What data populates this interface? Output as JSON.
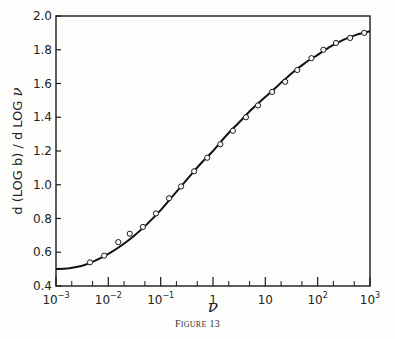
{
  "chart_data": {
    "type": "line",
    "title": "",
    "caption": "Figure 13",
    "xlabel": "ν",
    "ylabel": "d (LOG b) / d LOG ν",
    "xscale": "log",
    "xlim": [
      0.001,
      1000
    ],
    "ylim": [
      0.4,
      2.0
    ],
    "grid": false,
    "legend": null,
    "x_ticks": [
      "10^-3",
      "10^-2",
      "10^-1",
      "1",
      "10",
      "10^2",
      "10^3"
    ],
    "y_ticks": [
      "0.4",
      "0.6",
      "0.8",
      "1.0",
      "1.2",
      "1.4",
      "1.6",
      "1.8",
      "2.0"
    ],
    "series": [
      {
        "name": "theory (solid curve)",
        "style": "line",
        "log10_x": [
          -3.0,
          -2.75,
          -2.5,
          -2.25,
          -2.0,
          -1.75,
          -1.5,
          -1.25,
          -1.0,
          -0.75,
          -0.5,
          -0.25,
          0.0,
          0.25,
          0.5,
          0.75,
          1.0,
          1.25,
          1.5,
          1.75,
          2.0,
          2.25,
          2.5,
          2.75,
          3.0
        ],
        "values": [
          0.5,
          0.505,
          0.52,
          0.55,
          0.59,
          0.64,
          0.7,
          0.77,
          0.85,
          0.94,
          1.03,
          1.12,
          1.2,
          1.29,
          1.37,
          1.45,
          1.52,
          1.59,
          1.66,
          1.72,
          1.77,
          1.82,
          1.86,
          1.89,
          1.91
        ]
      },
      {
        "name": "data (open circles)",
        "style": "scatter",
        "log10_x": [
          -2.35,
          -2.08,
          -1.81,
          -1.59,
          -1.34,
          -1.09,
          -0.84,
          -0.61,
          -0.36,
          -0.11,
          0.14,
          0.38,
          0.63,
          0.86,
          1.13,
          1.38,
          1.61,
          1.88,
          2.11,
          2.35,
          2.62,
          2.89
        ],
        "values": [
          0.54,
          0.58,
          0.66,
          0.71,
          0.75,
          0.83,
          0.92,
          0.99,
          1.08,
          1.16,
          1.24,
          1.32,
          1.4,
          1.47,
          1.55,
          1.61,
          1.68,
          1.75,
          1.8,
          1.84,
          1.87,
          1.9
        ]
      }
    ]
  },
  "labels": {
    "ylabel_main": "d (LOG b) / d LOG ",
    "ylabel_nu": "ν",
    "xlabel": "ν",
    "caption_first": "F",
    "caption_rest": "IGURE",
    "caption_num": "13"
  },
  "colors": {
    "ink": "#1a1a1a",
    "background": "#fdfdfc"
  }
}
